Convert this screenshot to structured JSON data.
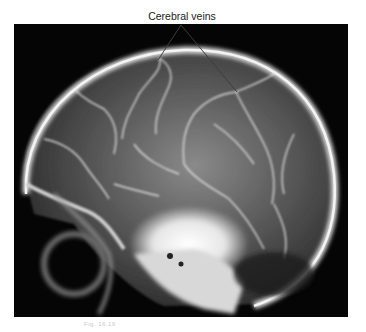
{
  "figure": {
    "label": "Cerebral veins",
    "caption": "Fig. 16.19"
  },
  "colors": {
    "background": "#ffffff",
    "film": "#050505",
    "bone": "#e8e8e8",
    "leader_line": "#111111"
  }
}
